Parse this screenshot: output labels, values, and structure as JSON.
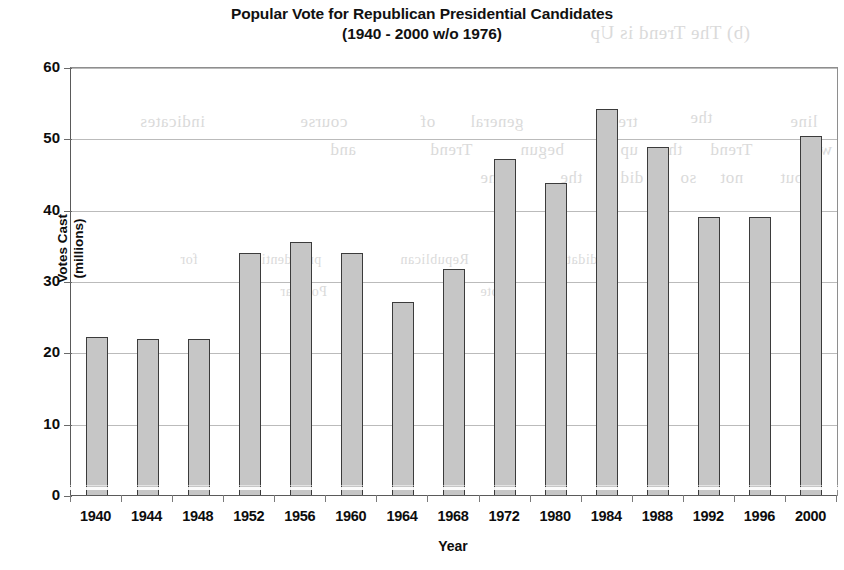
{
  "chart_data": {
    "type": "bar",
    "title": "Popular Vote for Republican Presidential Candidates",
    "subtitle": "(1940 - 2000 w/o 1976)",
    "xlabel": "Year",
    "ylabel": "Votes Cast (millions)",
    "ylabel_line1": "Votes Cast",
    "ylabel_line2": "(millions)",
    "ylim": [
      0,
      60
    ],
    "ytick_step": 10,
    "yticks": [
      0,
      10,
      20,
      30,
      40,
      50,
      60
    ],
    "ytick_labels": [
      "0",
      "10",
      "20",
      "30",
      "40",
      "50",
      "60"
    ],
    "grid": true,
    "legend": "none",
    "categories": [
      "1940",
      "1944",
      "1948",
      "1952",
      "1956",
      "1960",
      "1964",
      "1968",
      "1972",
      "1980",
      "1984",
      "1988",
      "1992",
      "1996",
      "2000"
    ],
    "values": [
      22.3,
      22.0,
      22.0,
      34.1,
      35.6,
      34.1,
      27.2,
      31.8,
      47.2,
      43.9,
      54.3,
      48.9,
      39.1,
      39.1,
      50.5
    ],
    "bar_fill_color": "#c6c6c6",
    "bar_border_color": "#3b3b3b",
    "gridline_color": "#bbbbbb",
    "axis_color": "#5a5a5a"
  },
  "ghost_text": [
    {
      "text": "(b) The Trend is Up",
      "x": 590,
      "y": 22,
      "size": 19
    },
    {
      "text": "the",
      "x": 690,
      "y": 108,
      "size": 17
    },
    {
      "text": "indicates",
      "x": 140,
      "y": 112,
      "size": 17
    },
    {
      "text": "course",
      "x": 300,
      "y": 112,
      "size": 17
    },
    {
      "text": "of",
      "x": 420,
      "y": 112,
      "size": 17
    },
    {
      "text": "general",
      "x": 470,
      "y": 112,
      "size": 17
    },
    {
      "text": "trend",
      "x": 600,
      "y": 112,
      "size": 17
    },
    {
      "text": "line",
      "x": 790,
      "y": 112,
      "size": 17
    },
    {
      "text": "and",
      "x": 330,
      "y": 140,
      "size": 17
    },
    {
      "text": "Trend",
      "x": 430,
      "y": 140,
      "size": 17
    },
    {
      "text": "begun",
      "x": 520,
      "y": 140,
      "size": 17
    },
    {
      "text": "up",
      "x": 620,
      "y": 140,
      "size": 17
    },
    {
      "text": "the",
      "x": 660,
      "y": 140,
      "size": 17
    },
    {
      "text": "Trend",
      "x": 710,
      "y": 140,
      "size": 17
    },
    {
      "text": "with",
      "x": 800,
      "y": 140,
      "size": 17
    },
    {
      "text": "one",
      "x": 480,
      "y": 168,
      "size": 17
    },
    {
      "text": "the",
      "x": 560,
      "y": 168,
      "size": 17
    },
    {
      "text": "did",
      "x": 620,
      "y": 168,
      "size": 17
    },
    {
      "text": "so",
      "x": 680,
      "y": 168,
      "size": 17
    },
    {
      "text": "not",
      "x": 720,
      "y": 168,
      "size": 17
    },
    {
      "text": "but",
      "x": 780,
      "y": 168,
      "size": 17
    },
    {
      "text": "candidate",
      "x": 560,
      "y": 252,
      "size": 14
    },
    {
      "text": "Republican",
      "x": 400,
      "y": 252,
      "size": 14
    },
    {
      "text": "presidential",
      "x": 250,
      "y": 252,
      "size": 14
    },
    {
      "text": "for",
      "x": 180,
      "y": 252,
      "size": 14
    },
    {
      "text": "vote",
      "x": 480,
      "y": 284,
      "size": 14
    },
    {
      "text": "Popular",
      "x": 280,
      "y": 284,
      "size": 14
    }
  ]
}
